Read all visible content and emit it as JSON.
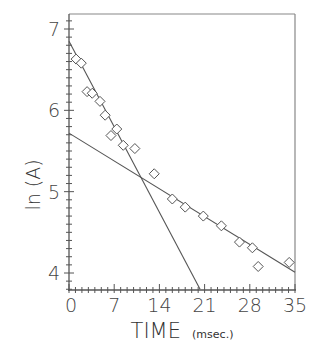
{
  "chart_data": {
    "type": "scatter",
    "title": "",
    "xlabel": "TIME",
    "xlabel_unit": "(msec.)",
    "ylabel": "ln (A)",
    "xlim": [
      0,
      35
    ],
    "ylim": [
      3.8,
      7.2
    ],
    "x_ticks": [
      0,
      7,
      14,
      21,
      28,
      35
    ],
    "y_ticks": [
      4,
      5,
      6,
      7
    ],
    "grid": false,
    "legend": null,
    "series": [
      {
        "name": "data",
        "marker": "diamond",
        "x": [
          1.1,
          1.9,
          2.8,
          3.6,
          4.8,
          5.6,
          6.5,
          7.4,
          8.4,
          10.2,
          13.2,
          16.0,
          18.0,
          20.8,
          23.6,
          26.4,
          28.4,
          29.3,
          34.1
        ],
        "y": [
          6.63,
          6.58,
          6.23,
          6.21,
          6.11,
          5.94,
          5.69,
          5.77,
          5.57,
          5.53,
          5.22,
          4.91,
          4.81,
          4.7,
          4.58,
          4.38,
          4.31,
          4.08,
          4.13
        ]
      },
      {
        "name": "fast-component fit",
        "type": "line",
        "x": [
          0,
          20.3
        ],
        "y": [
          6.85,
          3.8
        ]
      },
      {
        "name": "slow-component fit",
        "type": "line",
        "x": [
          0,
          35
        ],
        "y": [
          5.72,
          4.01
        ]
      }
    ]
  },
  "axes": {
    "x_tick_labels": [
      "0",
      "7",
      "14",
      "21",
      "28",
      "35"
    ],
    "y_tick_labels": [
      "4",
      "5",
      "6",
      "7"
    ],
    "xlabel_main": "TIME",
    "xlabel_unit": "(msec.)",
    "ylabel": "ln (A)"
  },
  "colors": {
    "ink": "#444444",
    "frame": "#888888",
    "background": "#ffffff"
  }
}
